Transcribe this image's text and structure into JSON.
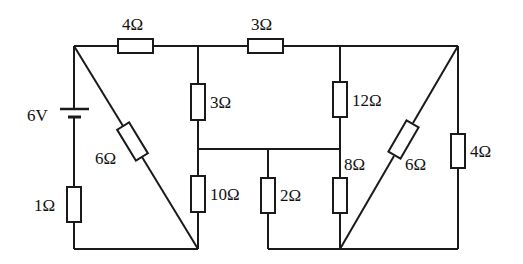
{
  "diagram": {
    "type": "circuit-schematic",
    "source": {
      "label": "6V"
    },
    "resistors": [
      {
        "id": "R_top_left",
        "label": "4Ω"
      },
      {
        "id": "R_top_right",
        "label": "3Ω"
      },
      {
        "id": "R_mid_left_upper",
        "label": "3Ω"
      },
      {
        "id": "R_mid_left_lower",
        "label": "10Ω"
      },
      {
        "id": "R_center",
        "label": "2Ω"
      },
      {
        "id": "R_mid_right_upper",
        "label": "12Ω"
      },
      {
        "id": "R_mid_right_lower",
        "label": "8Ω"
      },
      {
        "id": "R_diag_left",
        "label": "6Ω"
      },
      {
        "id": "R_diag_right",
        "label": "6Ω"
      },
      {
        "id": "R_series_source",
        "label": "1Ω"
      },
      {
        "id": "R_right_edge",
        "label": "4Ω"
      }
    ]
  }
}
